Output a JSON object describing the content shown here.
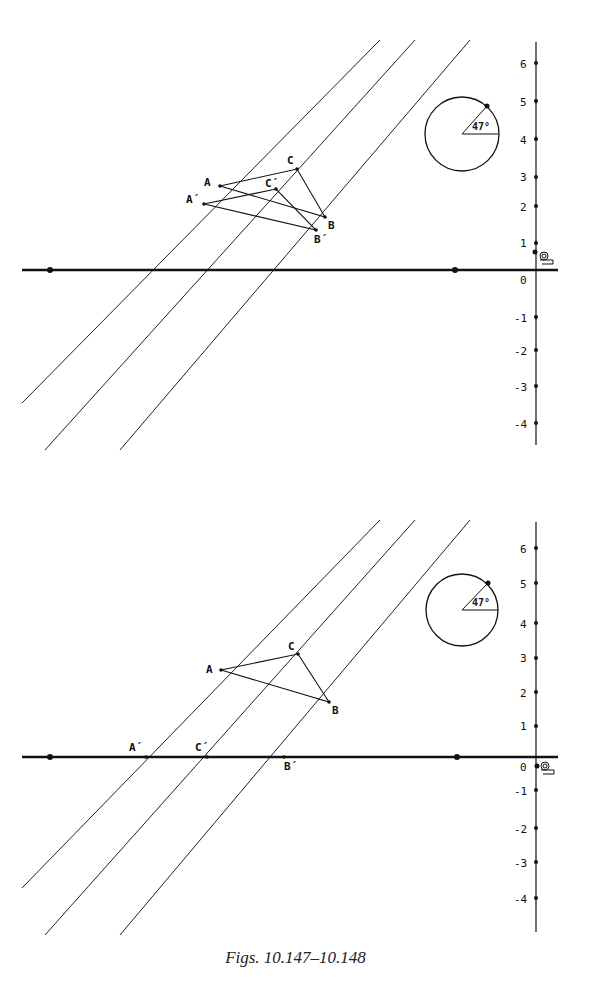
{
  "caption": "Figs. 10.147–10.148",
  "figures": [
    {
      "id": "fig-10-147",
      "y_axis_ticks": [
        "6",
        "5",
        "4",
        "3",
        "2",
        "1",
        "0",
        "-1",
        "-2",
        "-3",
        "-4"
      ],
      "angle_label": "47°",
      "points": {
        "A": "A",
        "B": "B",
        "C": "C",
        "A_prime": "A´",
        "B_prime": "B´",
        "C_prime": "C´"
      }
    },
    {
      "id": "fig-10-148",
      "y_axis_ticks": [
        "6",
        "5",
        "4",
        "3",
        "2",
        "1",
        "0",
        "-1",
        "-2",
        "-3",
        "-4"
      ],
      "angle_label": "47°",
      "points": {
        "A": "A",
        "B": "B",
        "C": "C",
        "A_prime": "A´",
        "B_prime": "B´",
        "C_prime": "C´"
      }
    }
  ]
}
